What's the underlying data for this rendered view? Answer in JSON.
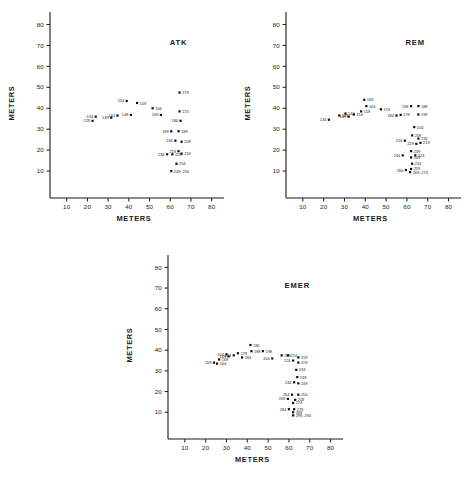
{
  "figure": {
    "name": "three-panel-scatter-figure",
    "background": "#ffffff",
    "ink": "#1a1a1a"
  },
  "axes_common": {
    "xlabel": "METERS",
    "ylabel": "METERS",
    "xticks": [
      10,
      20,
      30,
      40,
      50,
      60,
      70,
      80
    ],
    "yticks": [
      10,
      20,
      30,
      40,
      50,
      60,
      70,
      80
    ],
    "xlim": [
      0,
      85
    ],
    "ylim": [
      0,
      85
    ],
    "grid": false,
    "legend": "none"
  },
  "chart_data": [
    {
      "type": "scatter",
      "title": "ATK",
      "xlabel": "METERS",
      "ylabel": "METERS",
      "xlim": [
        0,
        85
      ],
      "ylim": [
        0,
        85
      ],
      "xticks": [
        10,
        20,
        30,
        40,
        50,
        60,
        70,
        80
      ],
      "yticks": [
        10,
        20,
        30,
        40,
        50,
        60,
        70,
        80
      ],
      "grid": false,
      "point_label_field": "id",
      "points": [
        {
          "id": "129",
          "x": 22.5,
          "y": 34.0,
          "label_side": "left"
        },
        {
          "id": "134",
          "x": 24.0,
          "y": 36.0,
          "label_side": "left"
        },
        {
          "id": "139",
          "x": 31.5,
          "y": 35.5,
          "label_side": "left"
        },
        {
          "id": "144",
          "x": 34.5,
          "y": 36.5,
          "label_side": "left"
        },
        {
          "id": "149",
          "x": 41.0,
          "y": 36.8,
          "label_side": "left"
        },
        {
          "id": "154",
          "x": 39.0,
          "y": 43.5,
          "label_side": "left"
        },
        {
          "id": "159",
          "x": 44.0,
          "y": 42.5,
          "label_side": "right"
        },
        {
          "id": "164",
          "x": 51.5,
          "y": 40.0,
          "label_side": "right"
        },
        {
          "id": "169",
          "x": 55.5,
          "y": 36.8,
          "label_side": "left"
        },
        {
          "id": "174",
          "x": 64.5,
          "y": 38.5,
          "label_side": "right"
        },
        {
          "id": "179",
          "x": 64.5,
          "y": 47.5,
          "label_side": "right"
        },
        {
          "id": "184",
          "x": 65.0,
          "y": 34.0,
          "label_side": "left"
        },
        {
          "id": "199",
          "x": 60.5,
          "y": 29.0,
          "label_side": "left"
        },
        {
          "id": "189",
          "x": 64.0,
          "y": 29.0,
          "label_side": "right"
        },
        {
          "id": "244",
          "x": 62.5,
          "y": 24.5,
          "label_side": "left"
        },
        {
          "id": "209",
          "x": 65.5,
          "y": 24.0,
          "label_side": "right"
        },
        {
          "id": "234",
          "x": 58.5,
          "y": 18.0,
          "label_side": "left"
        },
        {
          "id": "229",
          "x": 61.0,
          "y": 18.0,
          "label_side": "right"
        },
        {
          "id": "219",
          "x": 64.0,
          "y": 19.5,
          "label_side": "left"
        },
        {
          "id": "224",
          "x": 65.5,
          "y": 18.3,
          "label_side": "right"
        },
        {
          "id": "254",
          "x": 63.0,
          "y": 13.5,
          "label_side": "right"
        },
        {
          "id": "249, 254",
          "x": 60.5,
          "y": 10.0,
          "label_side": "right"
        }
      ]
    },
    {
      "type": "scatter",
      "title": "REM",
      "xlabel": "METERS",
      "ylabel": "METERS",
      "xlim": [
        0,
        85
      ],
      "ylim": [
        0,
        85
      ],
      "xticks": [
        10,
        20,
        30,
        40,
        50,
        60,
        70,
        80
      ],
      "yticks": [
        10,
        20,
        30,
        40,
        50,
        60,
        70,
        80
      ],
      "grid": false,
      "point_label_field": "id",
      "points": [
        {
          "id": "134",
          "x": 22.5,
          "y": 34.5,
          "label_side": "left"
        },
        {
          "id": "139",
          "x": 27.5,
          "y": 36.5,
          "label_side": "right"
        },
        {
          "id": "144",
          "x": 30.5,
          "y": 37.5,
          "label_side": "right"
        },
        {
          "id": "149",
          "x": 32.0,
          "y": 36.0,
          "label_side": "left"
        },
        {
          "id": "154",
          "x": 34.5,
          "y": 37.0,
          "label_side": "right"
        },
        {
          "id": "159",
          "x": 38.0,
          "y": 38.5,
          "label_side": "right"
        },
        {
          "id": "164",
          "x": 40.5,
          "y": 41.0,
          "label_side": "right"
        },
        {
          "id": "169",
          "x": 39.5,
          "y": 44.0,
          "label_side": "right"
        },
        {
          "id": "174",
          "x": 47.5,
          "y": 39.5,
          "label_side": "right"
        },
        {
          "id": "184",
          "x": 55.0,
          "y": 36.5,
          "label_side": "left"
        },
        {
          "id": "179",
          "x": 57.0,
          "y": 36.8,
          "label_side": "right"
        },
        {
          "id": "194",
          "x": 62.0,
          "y": 41.0,
          "label_side": "left"
        },
        {
          "id": "189",
          "x": 65.5,
          "y": 41.0,
          "label_side": "right"
        },
        {
          "id": "199",
          "x": 65.5,
          "y": 37.0,
          "label_side": "right"
        },
        {
          "id": "204",
          "x": 63.5,
          "y": 31.0,
          "label_side": "right"
        },
        {
          "id": "209",
          "x": 62.5,
          "y": 27.0,
          "label_side": "right"
        },
        {
          "id": "214",
          "x": 59.0,
          "y": 24.5,
          "label_side": "left"
        },
        {
          "id": "234",
          "x": 65.5,
          "y": 25.5,
          "label_side": "right"
        },
        {
          "id": "219",
          "x": 66.5,
          "y": 23.5,
          "label_side": "right"
        },
        {
          "id": "229",
          "x": 64.5,
          "y": 23.0,
          "label_side": "left"
        },
        {
          "id": "239",
          "x": 62.0,
          "y": 19.5,
          "label_side": "right"
        },
        {
          "id": "244",
          "x": 58.0,
          "y": 17.5,
          "label_side": "left"
        },
        {
          "id": "224",
          "x": 64.0,
          "y": 17.5,
          "label_side": "right"
        },
        {
          "id": "249",
          "x": 62.0,
          "y": 16.5,
          "label_side": "right"
        },
        {
          "id": "254",
          "x": 62.5,
          "y": 13.5,
          "label_side": "right"
        },
        {
          "id": "259",
          "x": 62.0,
          "y": 11.0,
          "label_side": "right"
        },
        {
          "id": "264",
          "x": 59.5,
          "y": 10.5,
          "label_side": "left"
        },
        {
          "id": "269, 274",
          "x": 61.5,
          "y": 9.5,
          "label_side": "right"
        }
      ]
    },
    {
      "type": "scatter",
      "title": "EMER",
      "xlabel": "METERS",
      "ylabel": "METERS",
      "xlim": [
        0,
        85
      ],
      "ylim": [
        0,
        85
      ],
      "xticks": [
        10,
        20,
        30,
        40,
        50,
        60,
        70,
        80
      ],
      "yticks": [
        10,
        20,
        30,
        40,
        50,
        60,
        70,
        80
      ],
      "grid": false,
      "point_label_field": "id",
      "points": [
        {
          "id": "159",
          "x": 24.0,
          "y": 34.0,
          "label_side": "left"
        },
        {
          "id": "164",
          "x": 25.5,
          "y": 33.5,
          "label_side": "right"
        },
        {
          "id": "169",
          "x": 26.5,
          "y": 35.5,
          "label_side": "right"
        },
        {
          "id": "154",
          "x": 30.0,
          "y": 38.0,
          "label_side": "left"
        },
        {
          "id": "149",
          "x": 31.0,
          "y": 37.0,
          "label_side": "left"
        },
        {
          "id": "174",
          "x": 33.5,
          "y": 37.5,
          "label_side": "left"
        },
        {
          "id": "179",
          "x": 35.5,
          "y": 38.5,
          "label_side": "right"
        },
        {
          "id": "184",
          "x": 37.5,
          "y": 36.5,
          "label_side": "right"
        },
        {
          "id": "194",
          "x": 41.5,
          "y": 42.5,
          "label_side": "right"
        },
        {
          "id": "189",
          "x": 42.0,
          "y": 39.5,
          "label_side": "right"
        },
        {
          "id": "199",
          "x": 47.5,
          "y": 39.5,
          "label_side": "right"
        },
        {
          "id": "204",
          "x": 52.0,
          "y": 36.0,
          "label_side": "left"
        },
        {
          "id": "209",
          "x": 56.5,
          "y": 37.5,
          "label_side": "right"
        },
        {
          "id": "214",
          "x": 59.5,
          "y": 37.5,
          "label_side": "right"
        },
        {
          "id": "219",
          "x": 64.5,
          "y": 36.5,
          "label_side": "right"
        },
        {
          "id": "224",
          "x": 62.0,
          "y": 35.0,
          "label_side": "left"
        },
        {
          "id": "229",
          "x": 64.5,
          "y": 34.0,
          "label_side": "right"
        },
        {
          "id": "234",
          "x": 63.5,
          "y": 30.5,
          "label_side": "right"
        },
        {
          "id": "239",
          "x": 64.0,
          "y": 27.0,
          "label_side": "right"
        },
        {
          "id": "244",
          "x": 62.5,
          "y": 24.5,
          "label_side": "left"
        },
        {
          "id": "249",
          "x": 64.5,
          "y": 24.0,
          "label_side": "right"
        },
        {
          "id": "264",
          "x": 61.5,
          "y": 18.5,
          "label_side": "left"
        },
        {
          "id": "254",
          "x": 64.5,
          "y": 18.5,
          "label_side": "right"
        },
        {
          "id": "269",
          "x": 59.5,
          "y": 16.5,
          "label_side": "left"
        },
        {
          "id": "259",
          "x": 63.0,
          "y": 16.0,
          "label_side": "right"
        },
        {
          "id": "274",
          "x": 62.0,
          "y": 14.5,
          "label_side": "right"
        },
        {
          "id": "284",
          "x": 60.0,
          "y": 11.5,
          "label_side": "left"
        },
        {
          "id": "279",
          "x": 62.5,
          "y": 11.5,
          "label_side": "right"
        },
        {
          "id": "289",
          "x": 62.0,
          "y": 10.0,
          "label_side": "right"
        },
        {
          "id": "299, 294",
          "x": 62.0,
          "y": 8.5,
          "label_side": "right"
        }
      ]
    }
  ]
}
